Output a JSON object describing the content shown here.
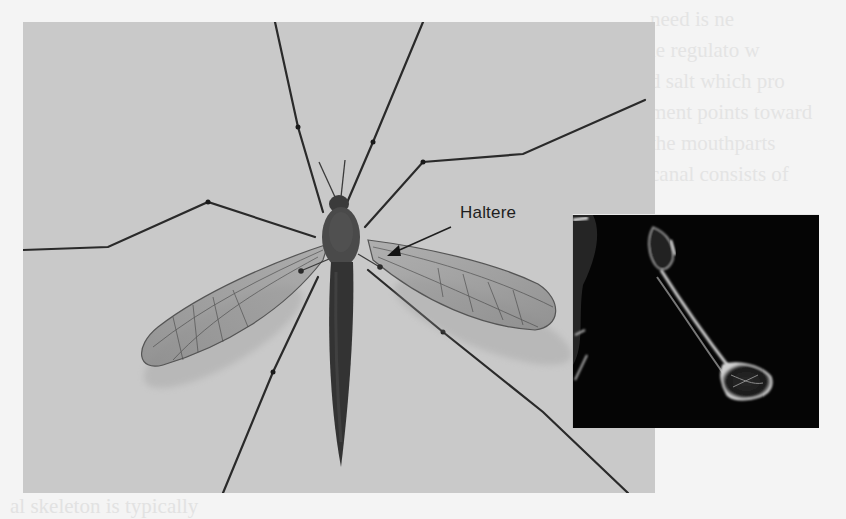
{
  "figure": {
    "callout_label": "Haltere",
    "inset": {
      "subject": "scanning electron micrograph of haltere",
      "background_color": "#050505"
    },
    "photo_background_color": "#c9c9c9",
    "page_background_color": "#f4f4f4"
  },
  "bleed_text": {
    "right_column_lines": [
      "need is ne",
      "le regulato w",
      "d salt which pro",
      "ment points toward",
      "the mouthparts",
      "canal consists of",
      "",
      "",
      "m",
      "ar",
      "m",
      "o",
      "s",
      "haryngeal skeleton",
      "head segment",
      "al skeleton is typically"
    ]
  }
}
